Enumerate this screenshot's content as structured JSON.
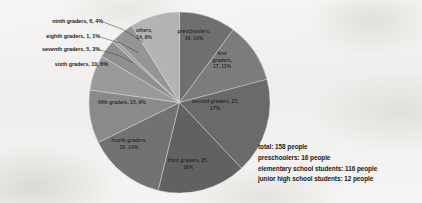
{
  "chart_data": {
    "type": "pie",
    "title": "",
    "categories": [
      "preschoolers",
      "first graders",
      "second graders",
      "third graders",
      "fourth graders",
      "fifth graders",
      "sixth graders",
      "seventh graders",
      "eighth graders",
      "ninth graders",
      "others"
    ],
    "values": [
      16,
      17,
      27,
      25,
      22,
      15,
      10,
      5,
      1,
      6,
      14
    ],
    "percents": [
      10,
      11,
      17,
      16,
      14,
      9,
      6,
      3,
      1,
      4,
      9
    ],
    "total": 158,
    "legend_position": "none",
    "labels_inside": true,
    "slice_colors": [
      "#6f6f6f",
      "#7c7c7c",
      "#6a6a6a",
      "#616161",
      "#727272",
      "#8a8a8a",
      "#9a9a9a",
      "#8f8f8f",
      "#a3a3a3",
      "#959595",
      "#b4b4b4"
    ],
    "data_labels": [
      {
        "name": "preschoolers",
        "text": "preschoolers,\n16, 10%",
        "placement": "inside"
      },
      {
        "name": "first graders",
        "text": "first\ngraders,\n17, 11%",
        "placement": "inside"
      },
      {
        "name": "second graders",
        "text": "second graders, 27,\n17%",
        "placement": "inside"
      },
      {
        "name": "third graders",
        "text": "third graders, 25,\n16%",
        "placement": "inside"
      },
      {
        "name": "fourth graders",
        "text": "fourth graders,\n22, 14%",
        "placement": "inside"
      },
      {
        "name": "fifth graders",
        "text": "fifth graders, 15, 9%",
        "placement": "inside"
      },
      {
        "name": "sixth graders",
        "text": "sixth graders, 10, 6%",
        "placement": "outside"
      },
      {
        "name": "seventh graders",
        "text": "seventh graders, 5, 3%",
        "placement": "outside"
      },
      {
        "name": "eighth graders",
        "text": "eighth graders, 1, 1%",
        "placement": "outside"
      },
      {
        "name": "ninth graders",
        "text": "ninth graders, 6, 4%",
        "placement": "outside"
      },
      {
        "name": "others",
        "text": "others,\n14, 9%",
        "placement": "inside"
      }
    ]
  },
  "labels": {
    "preschoolers": "preschoolers,\n16, 10%",
    "first_graders": "first\ngraders,\n17, 11%",
    "second_graders": "second graders, 27,\n17%",
    "third_graders": "third graders, 25,\n16%",
    "fourth_graders": "fourth graders,\n22, 14%",
    "fifth_graders": "fifth graders, 15, 9%",
    "sixth_graders": "sixth graders, 10, 6%",
    "seventh_graders": "seventh graders, 5, 3%",
    "eighth_graders": "eighth graders, 1, 1%",
    "ninth_graders": "ninth graders, 6, 4%",
    "others": "others,\n14, 9%"
  },
  "summary": {
    "total": "total: 158 people",
    "preschoolers": "preschoolers: 16 people",
    "elementary": "elementary school students: 116 people",
    "junior_high": "junior high school students: 12 people"
  }
}
